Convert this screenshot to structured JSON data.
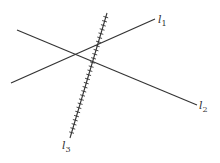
{
  "diagram": {
    "lines": [
      {
        "id": "l1",
        "label": "l",
        "subscript": "1",
        "x1": 11,
        "y1": 83,
        "x2": 155,
        "y2": 19,
        "hatched": false
      },
      {
        "id": "l2",
        "label": "l",
        "subscript": "2",
        "x1": 17,
        "y1": 30,
        "x2": 197,
        "y2": 105,
        "hatched": false
      },
      {
        "id": "l3",
        "label": "l",
        "subscript": "3",
        "x1": 107,
        "y1": 13,
        "x2": 70,
        "y2": 138,
        "hatched": true
      }
    ],
    "stroke_color": "#333333"
  }
}
